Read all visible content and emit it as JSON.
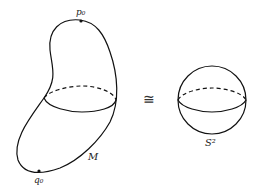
{
  "diagram": {
    "left_surface": {
      "label": "M",
      "top_point_label": "p₀",
      "bottom_point_label": "q₀"
    },
    "relation_symbol": "≅",
    "right_surface": {
      "label": "S²"
    }
  }
}
